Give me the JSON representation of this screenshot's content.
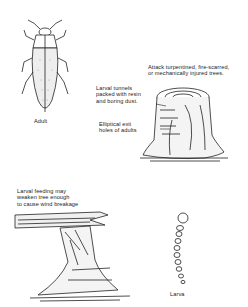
{
  "figure": {
    "labels": {
      "adult": "Adult",
      "attack": "Attack turpentined, fire-scarred,\nor mechanically injured trees.",
      "tunnels": "Larval tunnels\npacked with resin\nand boring dust.",
      "exit_holes": "Elliptical exit\nholes of adults",
      "wind": "Larval feeding may\nweaken tree enough\nto cause wind breakage",
      "larva": "Larva"
    }
  }
}
